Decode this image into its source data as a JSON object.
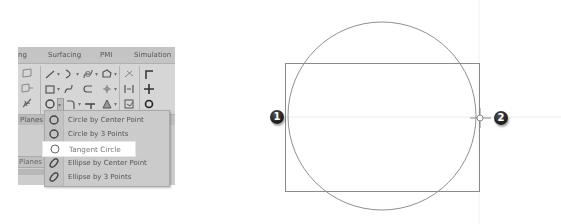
{
  "ribbon": {
    "tabs": [
      {
        "label": "ng"
      },
      {
        "label": "Surfacing"
      },
      {
        "label": "PMI"
      },
      {
        "label": "Simulation"
      }
    ],
    "group_label": "Planes",
    "icons": {
      "row1": [
        "line-icon",
        "arc-icon",
        "spline-icon",
        "polygon-icon",
        "trim-icon",
        "corner-icon"
      ],
      "row2": [
        "rectangle-icon",
        "curve-icon",
        "offset-c-icon",
        "pattern-icon",
        "mirror-icon",
        "plus-icon"
      ],
      "row3": [
        "circle-icon",
        "fillet-icon",
        "extend-icon",
        "triangle-icon",
        "project-icon",
        "point-icon"
      ]
    },
    "left_column_icons": [
      "plane-icon",
      "plane-add-icon",
      "axis-icon"
    ]
  },
  "side_label": "Planes",
  "dropdown": {
    "items": [
      {
        "label": "Circle by Center Point",
        "icon": "circle-icon",
        "highlighted": false
      },
      {
        "label": "Circle by 3 Points",
        "icon": "circle-icon",
        "highlighted": false
      },
      {
        "label": "Tangent Circle",
        "icon": "tangent-circle-icon",
        "highlighted": true
      },
      {
        "label": "Ellipse by Center Point",
        "icon": "ellipse-icon",
        "highlighted": false
      },
      {
        "label": "Ellipse by 3 Points",
        "icon": "ellipse-icon",
        "highlighted": false
      }
    ]
  },
  "canvas": {
    "markers": [
      {
        "label": "1"
      },
      {
        "label": "2"
      }
    ],
    "line_color": "#8a8a8a",
    "guide_color": "#e6e6e6"
  }
}
